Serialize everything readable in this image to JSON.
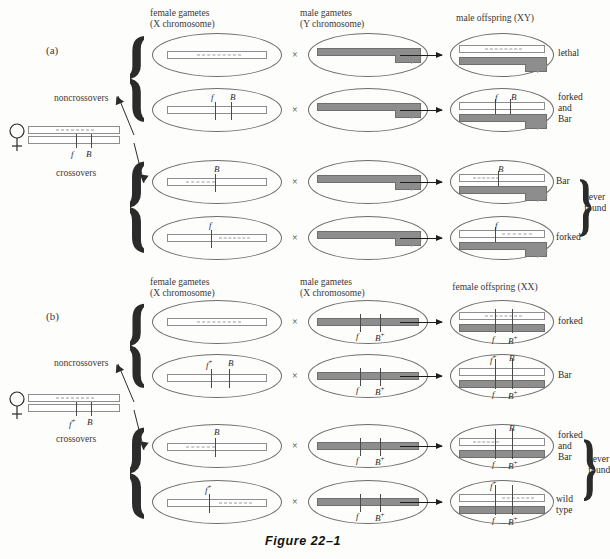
{
  "figure": {
    "caption": "Figure 22–1"
  },
  "panels": [
    {
      "id": "a",
      "label": "(a)",
      "headers": {
        "female_gametes": "female gametes\n(X chromosome)",
        "male_gametes": "male gametes\n(Y chromosome)",
        "offspring": "male offspring (XY)"
      },
      "parent": {
        "symbol": "♀",
        "top_chromosome_genes": [],
        "bottom_chromosome_genes": [
          "f",
          "B"
        ]
      },
      "group_labels": {
        "noncrossovers": "noncrossovers",
        "crossovers": "crossovers"
      },
      "cross_symbol": "×",
      "rows": [
        {
          "group": "noncrossovers",
          "female_gamete_genes": [],
          "male_gamete_genes": [],
          "offspring_genes_top": [],
          "offspring_genes_bottom": [],
          "outcome": "lethal",
          "never_found": false
        },
        {
          "group": "noncrossovers",
          "female_gamete_genes": [
            "f",
            "B"
          ],
          "male_gamete_genes": [],
          "offspring_genes_top": [
            "f",
            "B"
          ],
          "offspring_genes_bottom": [],
          "outcome": "forked\nand\nBar",
          "never_found": false
        },
        {
          "group": "crossovers",
          "female_gamete_genes": [
            "B"
          ],
          "male_gamete_genes": [],
          "offspring_genes_top": [
            "B"
          ],
          "offspring_genes_bottom": [],
          "outcome": "Bar",
          "never_found": true
        },
        {
          "group": "crossovers",
          "female_gamete_genes": [
            "f"
          ],
          "male_gamete_genes": [],
          "offspring_genes_top": [
            "f"
          ],
          "offspring_genes_bottom": [],
          "outcome": "forked",
          "never_found": true
        }
      ],
      "never_found_note": "never\nfound"
    },
    {
      "id": "b",
      "label": "(b)",
      "headers": {
        "female_gametes": "female gametes\n(X chromosome)",
        "male_gametes": "male gametes\n(X chromosome)",
        "offspring": "female offspring (XX)"
      },
      "parent": {
        "symbol": "♀",
        "top_chromosome_genes": [],
        "bottom_chromosome_genes": [
          "f+",
          "B"
        ]
      },
      "group_labels": {
        "noncrossovers": "noncrossovers",
        "crossovers": "crossovers"
      },
      "cross_symbol": "×",
      "rows": [
        {
          "group": "noncrossovers",
          "female_gamete_genes": [],
          "male_gamete_genes": [
            "f",
            "B+"
          ],
          "offspring_genes_top": [],
          "offspring_genes_bottom": [
            "f",
            "B+"
          ],
          "outcome": "forked",
          "never_found": false
        },
        {
          "group": "noncrossovers",
          "female_gamete_genes": [
            "f+",
            "B"
          ],
          "male_gamete_genes": [
            "f",
            "B+"
          ],
          "offspring_genes_top": [
            "f+",
            "B"
          ],
          "offspring_genes_bottom": [
            "f",
            "B+"
          ],
          "outcome": "Bar",
          "never_found": false
        },
        {
          "group": "crossovers",
          "female_gamete_genes": [
            "B"
          ],
          "male_gamete_genes": [
            "f",
            "B+"
          ],
          "offspring_genes_top": [
            "B"
          ],
          "offspring_genes_bottom": [
            "f",
            "B+"
          ],
          "outcome": "forked\nand\nBar",
          "never_found": true
        },
        {
          "group": "crossovers",
          "female_gamete_genes": [
            "f+"
          ],
          "male_gamete_genes": [
            "f",
            "B+"
          ],
          "offspring_genes_top": [
            "f+"
          ],
          "offspring_genes_bottom": [
            "f",
            "B+"
          ],
          "outcome": "wild\ntype",
          "never_found": true
        }
      ],
      "never_found_note": "never\nfound"
    }
  ],
  "colors": {
    "x_chromosome": "#ffffff",
    "y_chromosome": "#8d8d8d",
    "outline": "#6d6d6d",
    "text": "#2b2b2b"
  }
}
